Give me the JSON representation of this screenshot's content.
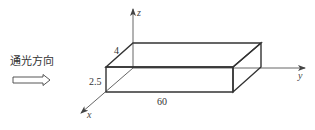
{
  "diagram": {
    "type": "3d-box-with-axes",
    "light_direction": {
      "label": "通光方向",
      "arrow": "right-hollow-arrow"
    },
    "axes": {
      "x": "x",
      "y": "y",
      "z": "z"
    },
    "dimensions": {
      "width_z_depth": "4",
      "height": "2.5",
      "length": "60"
    },
    "colors": {
      "line": "#333333",
      "axis": "#555555",
      "text": "#333333"
    }
  }
}
